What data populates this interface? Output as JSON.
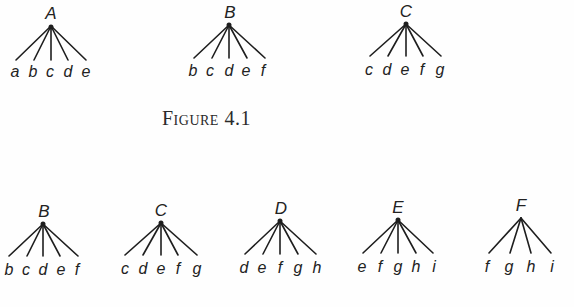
{
  "figures": [
    {
      "caption": "Figure 4.1",
      "trees": [
        {
          "root": "A",
          "leaves": [
            "a",
            "b",
            "c",
            "d",
            "e"
          ]
        },
        {
          "root": "B",
          "leaves": [
            "b",
            "c",
            "d",
            "e",
            "f"
          ]
        },
        {
          "root": "C",
          "leaves": [
            "c",
            "d",
            "e",
            "f",
            "g"
          ]
        }
      ]
    },
    {
      "trees": [
        {
          "root": "B",
          "leaves": [
            "b",
            "c",
            "d",
            "e",
            "f"
          ]
        },
        {
          "root": "C",
          "leaves": [
            "c",
            "d",
            "e",
            "f",
            "g"
          ]
        },
        {
          "root": "D",
          "leaves": [
            "d",
            "e",
            "f",
            "g",
            "h"
          ]
        },
        {
          "root": "E",
          "leaves": [
            "e",
            "f",
            "g",
            "h",
            "i"
          ]
        },
        {
          "root": "F",
          "leaves": [
            "f",
            "g",
            "h",
            "i"
          ]
        }
      ]
    }
  ],
  "colors": {
    "ink": "#1e1e1e",
    "background": "#fefefe"
  }
}
